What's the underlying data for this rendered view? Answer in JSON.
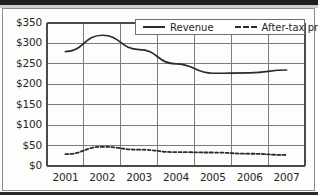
{
  "chart_data": {
    "type": "line",
    "title": "",
    "xlabel": "",
    "ylabel": "",
    "categories": [
      "2001",
      "2002",
      "2003",
      "2004",
      "2005",
      "2006",
      "2007"
    ],
    "x": [
      2001,
      2002,
      2003,
      2004,
      2005,
      2006,
      2007
    ],
    "ylim": [
      0,
      350
    ],
    "ytick_values": [
      0,
      50,
      100,
      150,
      200,
      250,
      300,
      350
    ],
    "ytick_labels": [
      "$0",
      "$50",
      "$100",
      "$150",
      "$200",
      "$250",
      "$300",
      "$350"
    ],
    "grid": true,
    "legend_position": "top-right-inside",
    "series": [
      {
        "name": "Revenue",
        "style": "solid",
        "color": "#2a2a2a",
        "values": [
          280,
          320,
          285,
          250,
          227,
          228,
          235
        ]
      },
      {
        "name": "After-tax profit",
        "style": "dashed",
        "color": "#2a2a2a",
        "values": [
          29,
          47,
          40,
          34,
          33,
          30,
          27
        ]
      }
    ]
  },
  "legend": {
    "revenue_label": "Revenue",
    "profit_label": "After-tax profit"
  },
  "colors": {
    "line": "#2a2a2a",
    "grid": "#7c7c7c",
    "axis": "#4a4a4a",
    "text": "#262626",
    "background": "#fdfdfc"
  }
}
